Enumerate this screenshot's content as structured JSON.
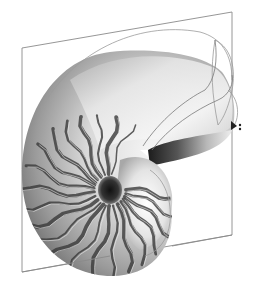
{
  "figure": {
    "style": "grayscale rendered 3D surface with perspective plane",
    "colors": {
      "background": "#ffffff",
      "plane_stroke": "#8a8a8a",
      "shell_light": "#f4f4f4",
      "shell_mid": "#bdbdbd",
      "shell_dark": "#5a5a5a",
      "stripe": "#3a3a3a",
      "umbilicus": "#1e1e1e",
      "cursor": "#222222"
    },
    "elements": {
      "plane": "perspective-bounding-plane",
      "shell": "nautilus-shell-body",
      "whorl": "upper-whorl",
      "aperture": "shell-aperture",
      "umbilicus": "shell-umbilicus",
      "stripes": "radial-stripe-pattern",
      "guides": "construction-curves"
    },
    "stripe_count": 22,
    "cursor": {
      "icon": "move-cursor-icon",
      "glyph": "▸⁑"
    }
  }
}
